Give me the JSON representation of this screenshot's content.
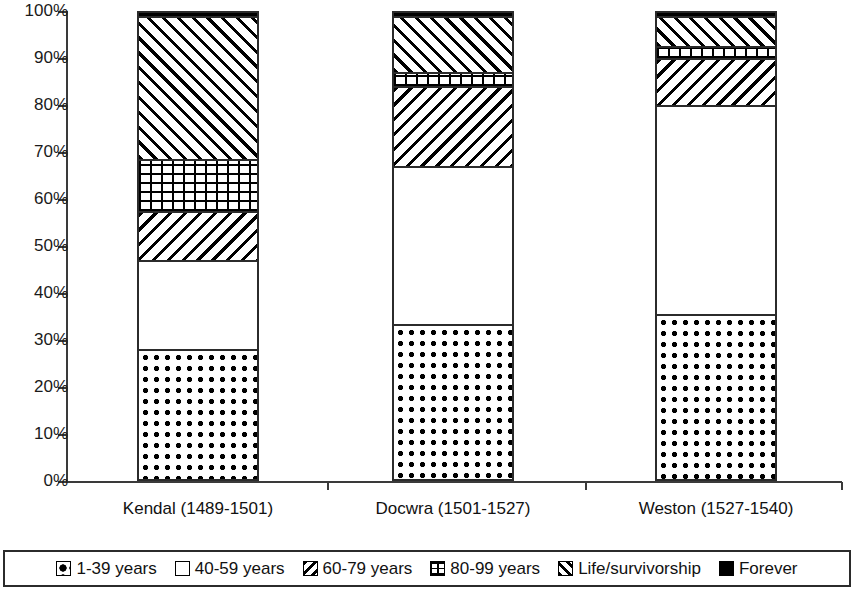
{
  "chart_data": {
    "type": "bar",
    "subtype": "stacked-percentage-column",
    "title": "",
    "subtitle": "",
    "xlabel": "",
    "ylabel": "",
    "ylim": [
      0,
      100
    ],
    "grid": false,
    "legend_position": "bottom",
    "y_tick_labels": [
      "100%",
      "90%",
      "80%",
      "70%",
      "60%",
      "50%",
      "40%",
      "30%",
      "20%",
      "10%",
      "0%"
    ],
    "y_tick_values": [
      100,
      90,
      80,
      70,
      60,
      50,
      40,
      30,
      20,
      10,
      0
    ],
    "categories": [
      "Kendal (1489-1501)",
      "Docwra (1501-1527)",
      "Weston (1527-1540)"
    ],
    "series": [
      {
        "name": "1-39 years",
        "pattern": "diamond",
        "values": [
          28.0,
          33.3,
          35.5
        ]
      },
      {
        "name": "40-59 years",
        "pattern": "plain",
        "values": [
          19.0,
          33.7,
          44.5
        ]
      },
      {
        "name": "60-79 years",
        "pattern": "backslash",
        "values": [
          10.5,
          17.0,
          10.0
        ]
      },
      {
        "name": "80-99 years",
        "pattern": "grid",
        "values": [
          11.0,
          3.0,
          2.5
        ]
      },
      {
        "name": "Life/survivorship",
        "pattern": "slash",
        "values": [
          30.5,
          12.0,
          6.5
        ]
      },
      {
        "name": "Forever",
        "pattern": "solid",
        "values": [
          1.0,
          1.0,
          1.0
        ]
      }
    ]
  },
  "legend": {
    "items": [
      {
        "label": "1-39 years",
        "swatch": "diamond-pattern-swatch"
      },
      {
        "label": "40-59 years",
        "swatch": "plain-white-swatch"
      },
      {
        "label": "60-79 years",
        "swatch": "backslash-hatch-swatch"
      },
      {
        "label": "80-99 years",
        "swatch": "grid-hatch-swatch"
      },
      {
        "label": "Life/survivorship",
        "swatch": "slash-hatch-swatch"
      },
      {
        "label": "Forever",
        "swatch": "solid-black-swatch"
      }
    ]
  },
  "colors": {
    "axis": "#3a3a3a",
    "bar_outline": "#2b2b2b",
    "fill": "#000000",
    "background": "#ffffff"
  }
}
